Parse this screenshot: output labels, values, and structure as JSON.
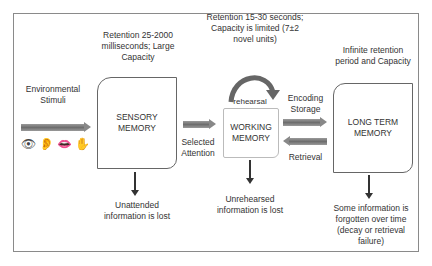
{
  "diagram": {
    "stages": [
      {
        "id": "sensory",
        "label": "SENSORY MEMORY",
        "above": "Retention 25-2000 milliseconds; Large Capacity",
        "below": "Unattended information is lost"
      },
      {
        "id": "working",
        "label": "WORKING MEMORY",
        "above": "Retention 15-30 seconds; Capacity is limited (7±2 novel units)",
        "below": "Unrehearsed information is lost",
        "loop_label": "rehearsal"
      },
      {
        "id": "ltm",
        "label": "LONG TERM MEMORY",
        "above": "Infinite retention period and Capacity",
        "below": "Some information is forgotten over time (decay or retrieval failure)"
      }
    ],
    "input": {
      "label": "Environmental Stimuli",
      "icons": [
        "eye-icon",
        "ear-icon",
        "mouth-icon",
        "hand-icon"
      ]
    },
    "edges": {
      "sensory_to_working": "Selected Attention",
      "working_to_ltm": "Encoding Storage",
      "ltm_to_working": "Retrieval"
    },
    "colors": {
      "arrow": "#7a7a7a",
      "border": "#666666",
      "text": "#333333"
    }
  }
}
